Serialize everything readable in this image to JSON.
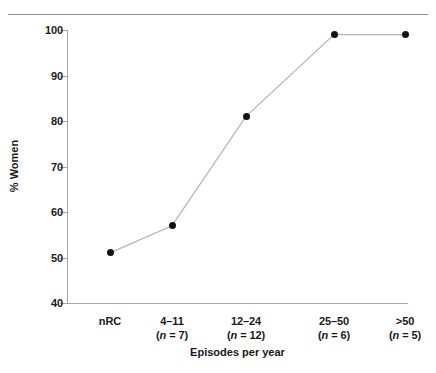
{
  "chart_data": {
    "type": "line",
    "title": "",
    "xlabel": "Episodes per year",
    "ylabel": "% Women",
    "categories": [
      "nRC",
      "4–11",
      "12–24",
      "25–50",
      ">50"
    ],
    "category_sublabels": [
      "",
      "(n = 7)",
      "(n = 12)",
      "(n = 6)",
      "(n = 5)"
    ],
    "group_sizes": [
      null,
      7,
      12,
      6,
      5
    ],
    "values": [
      51,
      57,
      81,
      99,
      99
    ],
    "ylim": [
      40,
      100
    ],
    "yticks": [
      40,
      50,
      60,
      70,
      80,
      90,
      100
    ],
    "ytick_labels": [
      "40",
      "50",
      "60",
      "70",
      "80",
      "90",
      "100"
    ],
    "grid": false,
    "legend": "none",
    "marker": "filled-circle",
    "marker_color": "#111111",
    "line_color": "#b5b5b5",
    "axis_color": "#a7a7a7",
    "text_color": "#1a1a1a",
    "background": "#ffffff"
  },
  "figure": {
    "top_rule_visible": true
  }
}
